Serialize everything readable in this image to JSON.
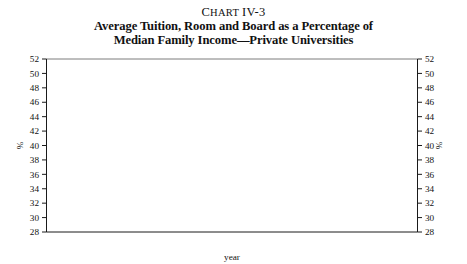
{
  "figure": {
    "chart_number_lead": "C",
    "chart_number_rest": "HART",
    "chart_number_id": "IV-3",
    "title_line_1": "Average Tuition, Room and Board as a Percentage of",
    "title_line_2": "Median Family Income—Private Universities"
  },
  "axes": {
    "y_left_label": "%",
    "y_right_label": "%",
    "x_label": "year",
    "y_ticks": [
      "28",
      "30",
      "32",
      "34",
      "36",
      "38",
      "40",
      "42",
      "44",
      "46",
      "48",
      "50",
      "52"
    ],
    "x_ticks": [
      "64",
      "66",
      "68",
      "70",
      "72",
      "74",
      "76",
      "78",
      "80",
      "82",
      "84",
      "86",
      "88",
      "90",
      "92"
    ]
  },
  "colors": {
    "line": "#1d1d1d",
    "axis": "#1a1a1a",
    "top_rule": "#6e6e6e",
    "background": "#ffffff"
  },
  "chart_data": {
    "type": "line",
    "title": "Average Tuition, Room and Board as a Percentage of Median Family Income—Private Universities",
    "subtitle": "Chart IV-3",
    "xlabel": "year",
    "ylabel": "%",
    "xlim": [
      63,
      93
    ],
    "ylim": [
      28,
      52
    ],
    "ytick_step": 2,
    "xtick_step": 2,
    "xtick_minor_step": 1,
    "grid": false,
    "legend": "none",
    "series": [
      {
        "name": "Average tuition, room and board as a percentage of median family income, private universities",
        "x": [
          1964,
          1965,
          1966,
          1967,
          1968,
          1969,
          1970,
          1971,
          1972,
          1973,
          1974,
          1975,
          1976,
          1977,
          1978,
          1979,
          1980,
          1981,
          1982,
          1983,
          1984,
          1985,
          1986,
          1987,
          1988,
          1989,
          1990,
          1991,
          1992
        ],
        "values": [
          33.5,
          33.3,
          32.9,
          32.2,
          30.9,
          30.9,
          31.8,
          32.8,
          32.0,
          30.8,
          31.3,
          32.6,
          31.9,
          31.5,
          31.6,
          30.1,
          31.2,
          33.3,
          36.3,
          37.4,
          38.6,
          39.8,
          41.7,
          42.4,
          43.8,
          43.9,
          46.5,
          48.8,
          50.3
        ]
      }
    ]
  }
}
